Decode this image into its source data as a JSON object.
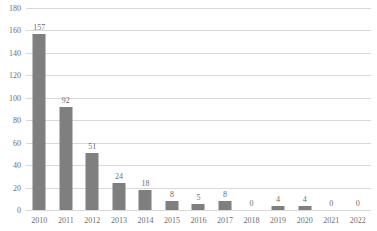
{
  "chart_data": {
    "type": "bar",
    "title": "",
    "subtitle": "",
    "xlabel": "",
    "ylabel": "",
    "categories": [
      "2010",
      "2011",
      "2012",
      "2013",
      "2014",
      "2015",
      "2016",
      "2017",
      "2018",
      "2019",
      "2020",
      "2021",
      "2022"
    ],
    "values": [
      157,
      92,
      51,
      24,
      18,
      8,
      5,
      8,
      0,
      4,
      4,
      0,
      0
    ],
    "data_labels": [
      "157",
      "92",
      "51",
      "24",
      "18",
      "8",
      "5",
      "8",
      "0",
      "4",
      "4",
      "0",
      "0"
    ],
    "ylim": [
      0,
      180
    ],
    "ytick_step": 20,
    "ytick_labels": [
      "180",
      "160",
      "140",
      "120",
      "100",
      "80",
      "60",
      "40",
      "20",
      "0"
    ],
    "ytick_values": [
      180,
      160,
      140,
      120,
      100,
      80,
      60,
      40,
      20,
      0
    ],
    "grid": true,
    "grid_axis": "y",
    "legend": false,
    "legend_position": "none",
    "series": [
      {
        "name": "",
        "values": [
          157,
          92,
          51,
          24,
          18,
          8,
          5,
          8,
          0,
          4,
          4,
          0,
          0
        ]
      }
    ],
    "colors": {
      "bar": "#7f7f7f",
      "gridline": "#d9d9d9",
      "text": "#6e6e6e",
      "background": "#ffffff"
    }
  }
}
